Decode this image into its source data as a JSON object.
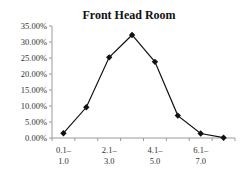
{
  "chart_data": {
    "type": "line",
    "title": "Front Head Room",
    "xlabel": "",
    "ylabel": "",
    "categories": [
      "0.1–1.0",
      "",
      "2.1–3.0",
      "",
      "4.1–5.0",
      "",
      "6.1–7.0",
      ""
    ],
    "x_tick_labels": [
      {
        "index": 0,
        "line1": "0.1–",
        "line2": "1.0"
      },
      {
        "index": 2,
        "line1": "2.1–",
        "line2": "3.0"
      },
      {
        "index": 4,
        "line1": "4.1–",
        "line2": "5.0"
      },
      {
        "index": 6,
        "line1": "6.1–",
        "line2": "7.0"
      }
    ],
    "series": [
      {
        "name": "Front Head Room",
        "values": [
          1.5,
          9.6,
          25.2,
          32.2,
          23.8,
          7.0,
          1.4,
          0.1
        ],
        "color": "#111111",
        "marker": "diamond"
      }
    ],
    "ylim": [
      0,
      35
    ],
    "y_ticks": [
      "0.00%",
      "5.00%",
      "10.00%",
      "15.00%",
      "20.00%",
      "25.00%",
      "30.00%",
      "35.00%"
    ],
    "y_tick_values": [
      0,
      5,
      10,
      15,
      20,
      25,
      30,
      35
    ],
    "grid": false,
    "legend": "none"
  }
}
